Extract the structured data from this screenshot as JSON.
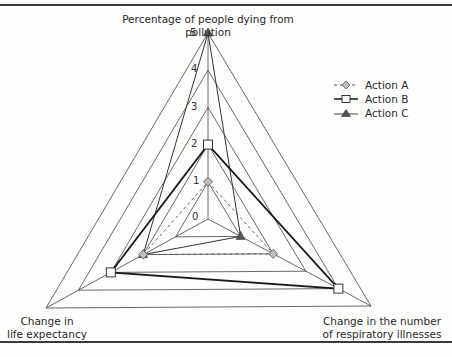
{
  "chart_data": {
    "type": "radar",
    "title": "",
    "axes": [
      "Percentage of people dying from pollution",
      "Change in the number of respiratory illnesses",
      "Change in life expectancy"
    ],
    "axis_labels": {
      "top": "Percentage of people dying from pollution",
      "right_line1": "Change in the number",
      "right_line2": "of respiratory illnesses",
      "left_line1": "Change in",
      "left_line2": "life expectancy"
    },
    "scale": {
      "min": 0,
      "max": 5,
      "ticks": [
        "0",
        "1",
        "2",
        "3",
        "4",
        "5"
      ]
    },
    "grid": true,
    "legend_position": "right",
    "series": [
      {
        "name": "Action A",
        "marker": "diamond",
        "line": "dashed",
        "color": "#9a9a9a",
        "values": {
          "pollution_deaths": 1,
          "respiratory_illnesses": 2,
          "life_expectancy": 2
        }
      },
      {
        "name": "Action B",
        "marker": "square",
        "line": "solid-bold",
        "color": "#ffffff",
        "values": {
          "pollution_deaths": 2,
          "respiratory_illnesses": 4,
          "life_expectancy": 3
        }
      },
      {
        "name": "Action C",
        "marker": "triangle",
        "line": "solid",
        "color": "#555555",
        "values": {
          "pollution_deaths": 5,
          "respiratory_illnesses": 1,
          "life_expectancy": 2
        }
      }
    ]
  },
  "legend": {
    "a": "Action A",
    "b": "Action B",
    "c": "Action C"
  }
}
